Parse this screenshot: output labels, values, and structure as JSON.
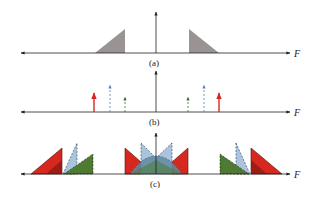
{
  "figure": {
    "panels": [
      {
        "id": "a",
        "caption": "(a)",
        "axis_label": "F",
        "description": "Baseband spectrum: two mirrored shaded triangles"
      },
      {
        "id": "b",
        "caption": "(b)",
        "axis_label": "F",
        "description": "Sampling impulses: red solid, blue dashed, green dashed arrows symmetric about origin"
      },
      {
        "id": "c",
        "caption": "(c)",
        "axis_label": "F",
        "description": "Aliased replicas: red, light-blue and green triangles overlapping"
      }
    ],
    "colors": {
      "spectrum_gray": "#9a9394",
      "red": "#d6281e",
      "blue": "#aac4de",
      "blue_line": "#5b7fb8",
      "green": "#4f7a32",
      "axis": "#222222"
    }
  }
}
